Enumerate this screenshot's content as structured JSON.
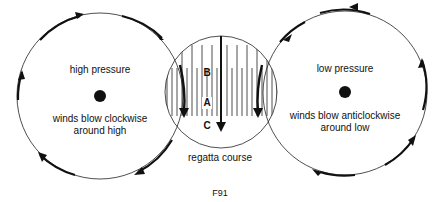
{
  "diagram": {
    "high": {
      "title": "high pressure",
      "caption_line1": "winds blow clockwise",
      "caption_line2": "around high"
    },
    "low": {
      "title": "low pressure",
      "caption_line1": "winds blow anticlockwise",
      "caption_line2": "around low"
    },
    "course": {
      "label": "regatta course",
      "marks": [
        "B",
        "A",
        "C"
      ]
    },
    "figure_label": "F91"
  }
}
